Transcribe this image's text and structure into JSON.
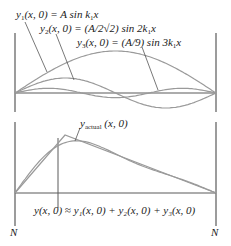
{
  "top_panel": {
    "labels": {
      "y1": {
        "lhs_var": "y",
        "lhs_sub": "1",
        "args": "(x, 0) = A sin k",
        "ksub": "1",
        "tail": "x"
      },
      "y2": {
        "lhs_var": "y",
        "lhs_sub": "2",
        "args": "(x, 0) = (A/2√2) sin 2k",
        "ksub": "1",
        "tail": "x"
      },
      "y3": {
        "lhs_var": "y",
        "lhs_sub": "3",
        "args": "(x, 0) = (A/9) sin 3k",
        "ksub": "1",
        "tail": "x"
      }
    },
    "amplitudes_px": {
      "y1": 42,
      "y2": 15,
      "y3": 4.7
    }
  },
  "bottom_panel": {
    "actual_label": {
      "var": "y",
      "sub": "actual",
      "args": " (x, 0)"
    },
    "sum_label": "y(x, 0) ≈ y₁(x, 0) + y₂(x, 0) + y₃(x, 0)",
    "node_left": "N",
    "node_right": "N"
  },
  "colors": {
    "frame": "#5a5a5a",
    "curve": "#9a9a9a",
    "leader": "#555555",
    "text": "#222222"
  }
}
